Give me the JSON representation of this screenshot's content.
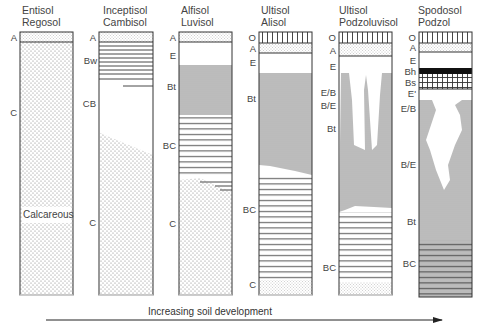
{
  "figure": {
    "arrow_caption": "Increasing soil development",
    "profiles": [
      {
        "id": "entisol",
        "title_line1": "Entisol",
        "title_line2": "Regosol",
        "horizons": [
          "A",
          "C"
        ],
        "annotation": "Calcareous"
      },
      {
        "id": "inceptisol",
        "title_line1": "Inceptisol",
        "title_line2": "Cambisol",
        "horizons": [
          "A",
          "Bw",
          "CB",
          "C"
        ]
      },
      {
        "id": "alfisol",
        "title_line1": "Alfisol",
        "title_line2": "Luvisol",
        "horizons": [
          "A",
          "E",
          "Bt",
          "BC",
          "C"
        ]
      },
      {
        "id": "ultisol-alisol",
        "title_line1": "Ultisol",
        "title_line2": "Alisol",
        "horizons": [
          "O",
          "A",
          "E",
          "Bt",
          "BC",
          "C"
        ]
      },
      {
        "id": "ultisol-podzoluvisol",
        "title_line1": "Ultisol",
        "title_line2": "Podzoluvisol",
        "horizons": [
          "O",
          "A",
          "E",
          "E/B",
          "B/E",
          "Bt",
          "BC"
        ]
      },
      {
        "id": "spodosol",
        "title_line1": "Spodosol",
        "title_line2": "Podzol",
        "horizons": [
          "O",
          "A",
          "E",
          "Bh",
          "Bs",
          "E'",
          "E/B",
          "B/E",
          "Bt",
          "BC"
        ]
      }
    ]
  },
  "colors": {
    "line": "#333333",
    "text": "#444444",
    "bh_fill": "#111111",
    "dot": "#777777"
  }
}
